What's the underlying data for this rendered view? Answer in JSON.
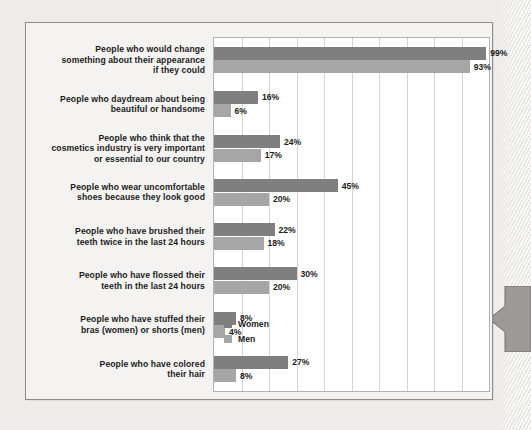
{
  "chart_data": {
    "type": "bar",
    "orientation": "horizontal",
    "title": "",
    "xlabel": "",
    "ylabel": "",
    "xlim": [
      0,
      100
    ],
    "xunit": "%",
    "grid": true,
    "gridline_step": 10,
    "legend_position": "inside-bottom-right",
    "categories": [
      "People who would change something about their appearance if they could",
      "People who daydream about being beautiful or handsome",
      "People who think that the cosmetics industry is very important or essential to our country",
      "People who wear uncomfortable shoes because they look good",
      "People who have brushed their teeth twice in the last 24 hours",
      "People who have flossed their teeth in the last 24 hours",
      "People who have stuffed their bras (women) or shorts (men)",
      "People who have colored their hair"
    ],
    "series": [
      {
        "name": "Women",
        "color": "#7f7f7f",
        "values": [
          99,
          16,
          24,
          45,
          22,
          30,
          8,
          27
        ]
      },
      {
        "name": "Men",
        "color": "#a6a6a6",
        "values": [
          93,
          6,
          17,
          20,
          18,
          20,
          4,
          8
        ]
      }
    ]
  },
  "rows": [
    {
      "label_lines": [
        "People who would change",
        "something about their appearance",
        "if they could"
      ],
      "women": 99,
      "men": 93,
      "women_label": "99%",
      "men_label": "93%"
    },
    {
      "label_lines": [
        "People who daydream about being",
        "beautiful or handsome"
      ],
      "women": 16,
      "men": 6,
      "women_label": "16%",
      "men_label": "6%"
    },
    {
      "label_lines": [
        "People who think that the",
        "cosmetics industry is very important",
        "or essential to our country"
      ],
      "women": 24,
      "men": 17,
      "women_label": "24%",
      "men_label": "17%"
    },
    {
      "label_lines": [
        "People who wear uncomfortable",
        "shoes because they look good"
      ],
      "women": 45,
      "men": 20,
      "women_label": "45%",
      "men_label": "20%"
    },
    {
      "label_lines": [
        "People who have brushed their",
        "teeth twice in the last 24 hours"
      ],
      "women": 22,
      "men": 18,
      "women_label": "22%",
      "men_label": "18%"
    },
    {
      "label_lines": [
        "People who have flossed their",
        "teeth in the last 24 hours"
      ],
      "women": 30,
      "men": 20,
      "women_label": "30%",
      "men_label": "20%"
    },
    {
      "label_lines": [
        "People who have stuffed their",
        "bras (women) or shorts (men)"
      ],
      "women": 8,
      "men": 4,
      "women_label": "8%",
      "men_label": "4%"
    },
    {
      "label_lines": [
        "People who have colored",
        "their hair"
      ],
      "women": 27,
      "men": 8,
      "women_label": "27%",
      "men_label": "8%"
    }
  ],
  "legend": {
    "items": [
      {
        "label": "Women",
        "color": "#7f7f7f"
      },
      {
        "label": "Men",
        "color": "#a6a6a6"
      }
    ]
  },
  "colors": {
    "women": "#7f7f7f",
    "men": "#a6a6a6",
    "panel_background": "#f4f3f1",
    "page_background": "#edecea",
    "plot_background": "#ffffff",
    "gridline": "#d6d4d1",
    "text": "#1b1b1b",
    "arrow": "#9b9a97"
  }
}
